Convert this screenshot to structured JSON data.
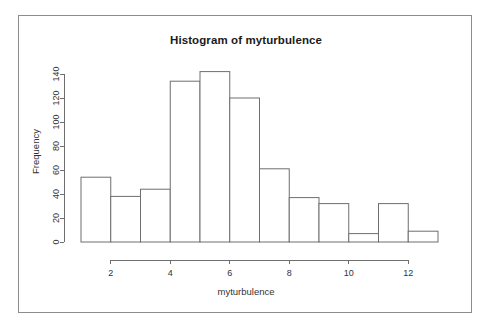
{
  "page": {
    "background_color": "#ffffff",
    "frame_border_color": "#8c8c8c"
  },
  "chart_data": {
    "type": "bar",
    "subtype": "histogram",
    "title": "Histogram of myturbulence",
    "subtitle": "",
    "xlabel": "myturbulence",
    "ylabel": "Frequency",
    "xlim": [
      1,
      13
    ],
    "ylim": [
      0,
      145
    ],
    "xticks": [
      2,
      4,
      6,
      8,
      10,
      12
    ],
    "xtick_labels": [
      "2",
      "4",
      "6",
      "8",
      "10",
      "12"
    ],
    "yticks": [
      0,
      20,
      40,
      60,
      80,
      100,
      120,
      140
    ],
    "ytick_labels": [
      "0",
      "20",
      "40",
      "60",
      "80",
      "100",
      "120",
      "140"
    ],
    "grid": false,
    "legend": false,
    "legend_position": "none",
    "bin_width": 1,
    "bin_edges": [
      1,
      2,
      3,
      4,
      5,
      6,
      7,
      8,
      9,
      10,
      11,
      12,
      13
    ],
    "categories": [
      "1-2",
      "2-3",
      "3-4",
      "4-5",
      "5-6",
      "6-7",
      "7-8",
      "8-9",
      "9-10",
      "10-11",
      "11-12",
      "12-13"
    ],
    "values": [
      54,
      38,
      44,
      134,
      142,
      120,
      61,
      37,
      32,
      7,
      32,
      9
    ],
    "bar_fill_color": "#ffffff",
    "bar_stroke_color": "#6e6e6e",
    "axis_color": "#6e6e6e"
  }
}
